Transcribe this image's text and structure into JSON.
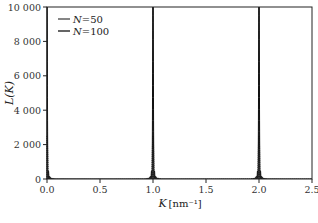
{
  "chart_data": {
    "type": "line",
    "title": "",
    "xlabel": "K",
    "xlabel_unit": "[nm⁻¹]",
    "ylabel": "L(K)",
    "xlim": [
      0.0,
      2.5
    ],
    "ylim": [
      0,
      10000
    ],
    "xticks": [
      0.0,
      0.5,
      1.0,
      1.5,
      2.0,
      2.5
    ],
    "xtick_labels": [
      "0.0",
      "0.5",
      "1.0",
      "1.5",
      "2.0",
      "2.5"
    ],
    "yticks": [
      0,
      2000,
      4000,
      6000,
      8000,
      10000
    ],
    "ytick_labels": [
      "0",
      "2 000",
      "4 000",
      "6 000",
      "8 000",
      "10 000"
    ],
    "grid": false,
    "legend_position": "top-left",
    "peak_positions": [
      0.0,
      1.0,
      2.0
    ],
    "period": 1.0,
    "series": [
      {
        "name": "N=50",
        "label_var": "N",
        "label_value": "50",
        "N": 50,
        "peak_height": 2500,
        "style": "dotted",
        "color": "#444444"
      },
      {
        "name": "N=100",
        "label_var": "N",
        "label_value": "100",
        "N": 100,
        "peak_height": 10000,
        "style": "solid",
        "color": "#111111"
      }
    ]
  }
}
